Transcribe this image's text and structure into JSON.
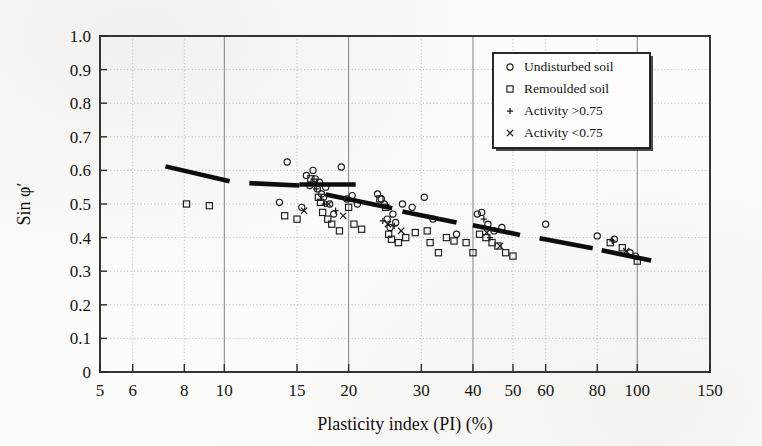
{
  "chart_data": {
    "type": "scatter",
    "title": "",
    "xlabel": "Plasticity index (PI) (%)",
    "ylabel": "Sin φ′",
    "xscale": "log",
    "xlim": [
      5,
      150
    ],
    "ylim": [
      0,
      1.0
    ],
    "grid": true,
    "legend_position": "top-right",
    "xticks": [
      5,
      6,
      8,
      10,
      15,
      20,
      30,
      40,
      50,
      60,
      80,
      100,
      150
    ],
    "xtick_labels": [
      "5",
      "6",
      "8",
      "10",
      "15",
      "20",
      "30",
      "40",
      "50",
      "60",
      "80",
      "100",
      "150"
    ],
    "yticks": [
      0,
      0.1,
      0.2,
      0.3,
      0.4,
      0.5,
      0.6,
      0.7,
      0.8,
      0.9,
      1.0
    ],
    "ytick_labels": [
      "0",
      "0.1",
      "0.2",
      "0.3",
      "0.4",
      "0.5",
      "0.6",
      "0.7",
      "0.8",
      "0.9",
      "1.0"
    ],
    "legend": [
      {
        "marker": "circle",
        "label": "Undisturbed soil"
      },
      {
        "marker": "square",
        "label": "Remoulded soil"
      },
      {
        "marker": "plus",
        "label": "Activity >0.75"
      },
      {
        "marker": "cross",
        "label": "Activity <0.75"
      }
    ],
    "series": [
      {
        "name": "Undisturbed soil",
        "marker": "circle",
        "points": [
          [
            13.6,
            0.505
          ],
          [
            14.2,
            0.625
          ],
          [
            15.4,
            0.49
          ],
          [
            15.8,
            0.585
          ],
          [
            16.1,
            0.555
          ],
          [
            16.4,
            0.6
          ],
          [
            16.6,
            0.575
          ],
          [
            16.8,
            0.545
          ],
          [
            17.0,
            0.565
          ],
          [
            17.2,
            0.53
          ],
          [
            17.4,
            0.52
          ],
          [
            17.6,
            0.55
          ],
          [
            18.0,
            0.5
          ],
          [
            18.4,
            0.47
          ],
          [
            19.2,
            0.61
          ],
          [
            19.8,
            0.515
          ],
          [
            20.4,
            0.525
          ],
          [
            21.0,
            0.5
          ],
          [
            23.5,
            0.53
          ],
          [
            24.0,
            0.515
          ],
          [
            24.4,
            0.5
          ],
          [
            24.8,
            0.455
          ],
          [
            25.2,
            0.43
          ],
          [
            25.6,
            0.47
          ],
          [
            26.0,
            0.445
          ],
          [
            27.0,
            0.5
          ],
          [
            28.5,
            0.49
          ],
          [
            30.5,
            0.52
          ],
          [
            32.0,
            0.455
          ],
          [
            36.5,
            0.41
          ],
          [
            41.0,
            0.47
          ],
          [
            42.0,
            0.475
          ],
          [
            43.5,
            0.44
          ],
          [
            45.0,
            0.42
          ],
          [
            47.0,
            0.43
          ],
          [
            60.0,
            0.44
          ],
          [
            80.0,
            0.405
          ],
          [
            88.0,
            0.395
          ],
          [
            96.0,
            0.355
          ],
          [
            99.0,
            0.345
          ]
        ]
      },
      {
        "name": "Remoulded soil",
        "marker": "square",
        "points": [
          [
            8.1,
            0.5
          ],
          [
            9.2,
            0.495
          ],
          [
            14.0,
            0.465
          ],
          [
            15.0,
            0.455
          ],
          [
            16.2,
            0.575
          ],
          [
            16.5,
            0.565
          ],
          [
            16.9,
            0.52
          ],
          [
            17.1,
            0.505
          ],
          [
            17.3,
            0.475
          ],
          [
            17.8,
            0.455
          ],
          [
            18.2,
            0.44
          ],
          [
            19.0,
            0.42
          ],
          [
            20.0,
            0.49
          ],
          [
            20.6,
            0.44
          ],
          [
            21.5,
            0.425
          ],
          [
            23.8,
            0.515
          ],
          [
            24.6,
            0.49
          ],
          [
            25.0,
            0.41
          ],
          [
            25.4,
            0.395
          ],
          [
            26.4,
            0.385
          ],
          [
            27.5,
            0.4
          ],
          [
            29.0,
            0.415
          ],
          [
            31.0,
            0.42
          ],
          [
            31.5,
            0.385
          ],
          [
            33.0,
            0.355
          ],
          [
            34.5,
            0.4
          ],
          [
            36.0,
            0.39
          ],
          [
            38.5,
            0.385
          ],
          [
            40.0,
            0.355
          ],
          [
            41.5,
            0.41
          ],
          [
            43.0,
            0.4
          ],
          [
            44.5,
            0.385
          ],
          [
            46.0,
            0.375
          ],
          [
            48.0,
            0.355
          ],
          [
            50.0,
            0.345
          ],
          [
            86.0,
            0.385
          ],
          [
            92.0,
            0.37
          ],
          [
            100.0,
            0.33
          ]
        ]
      },
      {
        "name": "Activity >0.75",
        "marker": "plus",
        "points": [
          [
            16.7,
            0.545
          ],
          [
            17.5,
            0.5
          ],
          [
            18.6,
            0.48
          ],
          [
            24.2,
            0.45
          ],
          [
            25.8,
            0.435
          ],
          [
            42.5,
            0.455
          ],
          [
            44.0,
            0.4
          ],
          [
            87.0,
            0.39
          ]
        ]
      },
      {
        "name": "Activity <0.75",
        "marker": "cross",
        "points": [
          [
            15.6,
            0.48
          ],
          [
            17.9,
            0.5
          ],
          [
            19.4,
            0.465
          ],
          [
            24.9,
            0.44
          ],
          [
            26.8,
            0.42
          ],
          [
            43.2,
            0.415
          ],
          [
            46.5,
            0.375
          ],
          [
            94.0,
            0.36
          ]
        ]
      }
    ],
    "trend_line": {
      "style": "thick-dashed",
      "description": "Decreasing correlation band of sin phi' versus plasticity index",
      "segments": [
        [
          [
            7.2,
            0.612
          ],
          [
            10.3,
            0.568
          ]
        ],
        [
          [
            11.5,
            0.562
          ],
          [
            15.2,
            0.555
          ]
        ],
        [
          [
            15.2,
            0.558
          ],
          [
            20.8,
            0.558
          ]
        ],
        [
          [
            17.6,
            0.528
          ],
          [
            25.5,
            0.487
          ]
        ],
        [
          [
            27.0,
            0.478
          ],
          [
            36.5,
            0.445
          ]
        ],
        [
          [
            40.0,
            0.437
          ],
          [
            52.0,
            0.408
          ]
        ],
        [
          [
            58.0,
            0.398
          ],
          [
            78.0,
            0.368
          ]
        ],
        [
          [
            82.0,
            0.362
          ],
          [
            108.0,
            0.332
          ]
        ]
      ]
    }
  }
}
